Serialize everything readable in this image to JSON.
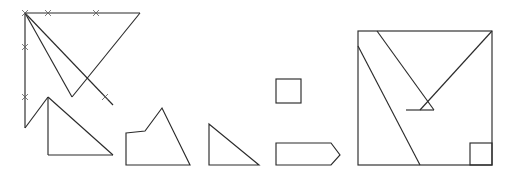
{
  "canvas": {
    "width": 512,
    "height": 178,
    "background": "#ffffff",
    "stroke_color": "#2b2b2b",
    "tick_color": "#5a5a5a"
  },
  "figures": [
    {
      "id": "figure-1",
      "name": "inverted-triangle-with-right-triangle",
      "description": "Large inverted triangle with crossing diagonal and lower right triangle, with tick marks",
      "elements": {
        "top_edge": "25,13 140,13",
        "left_edge": "25,13 25,128",
        "left_diagonal_to_apex": "25,13 72,97",
        "right_diagonal_to_apex": "140,13 72,97",
        "long_diagonal": "25,13 113,105",
        "lower_vertical": "48,97 48,155",
        "lower_bottom": "48,155 113,155",
        "lower_hypotenuse": "48,97 113,155",
        "left_lower_segment": "25,128 48,97"
      },
      "tick_marks": [
        {
          "x": 48,
          "y": 13,
          "label": "tick-top-left"
        },
        {
          "x": 96,
          "y": 13,
          "label": "tick-top-right"
        },
        {
          "x": 25,
          "y": 47,
          "label": "tick-left-upper"
        },
        {
          "x": 25,
          "y": 97,
          "label": "tick-left-lower"
        },
        {
          "x": 105,
          "y": 97,
          "label": "tick-diagonal"
        },
        {
          "x": 25,
          "y": 13,
          "label": "tick-origin"
        }
      ]
    },
    {
      "id": "figure-2",
      "name": "mountain-polygon",
      "description": "Mountain or house-like polygon with a peak",
      "points": "126,133 145,131 162,108 190,165 126,165"
    },
    {
      "id": "figure-3",
      "name": "right-triangle",
      "description": "Right triangle with vertical left leg and horizontal bottom",
      "points": "209,124 209,165 259,165"
    },
    {
      "id": "figure-4a",
      "name": "small-square",
      "description": "Small square outline",
      "rect": {
        "x": 276,
        "y": 79,
        "width": 25,
        "height": 24
      }
    },
    {
      "id": "figure-4b",
      "name": "arrow-pentagon",
      "description": "Right-pointing arrow pentagon",
      "points": "276,143 331,143 340,155 331,165 276,165"
    },
    {
      "id": "figure-5",
      "name": "tangram-square",
      "description": "Large square with tangram-style internal diagonals and small corner square",
      "outer_rect": {
        "x": 358,
        "y": 31,
        "width": 134,
        "height": 134
      },
      "inner_lines": [
        "358,46 420,165",
        "377,31 434,110",
        "492,31 420,110",
        "406,110 434,110"
      ],
      "corner_square": {
        "x": 470,
        "y": 143,
        "width": 22,
        "height": 22
      }
    }
  ],
  "labels": {
    "tick_glyph": "×"
  }
}
